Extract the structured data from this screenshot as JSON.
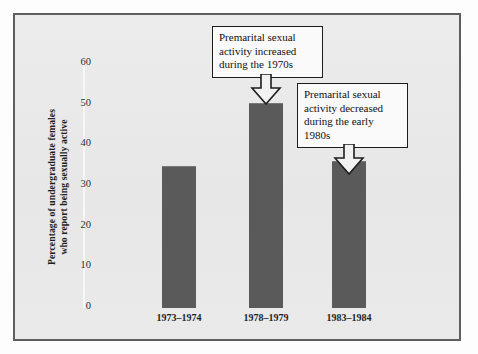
{
  "chart_data": {
    "type": "bar",
    "title": "",
    "xlabel": "",
    "ylabel": "Percentage of undergraduate females\nwho report being sexually active",
    "ylabel_line1": "Percentage of undergraduate females",
    "ylabel_line2": "who report being sexually active",
    "categories": [
      "1973–1974",
      "1978–1979",
      "1983–1984"
    ],
    "values": [
      34.6,
      50.2,
      36.0
    ],
    "ylim": [
      0,
      60
    ],
    "yticks": [
      0,
      10,
      20,
      30,
      40,
      50,
      60
    ],
    "ytick_labels": [
      "0",
      "10",
      "20",
      "30",
      "40",
      "50",
      "60"
    ],
    "grid": false,
    "legend": "none",
    "bar_color": "#5a5a5a",
    "annotations": [
      {
        "id": "callout-increase",
        "text": "Premarital sexual activity increased during the 1970s",
        "lines": [
          "Premarital sexual",
          "activity increased",
          "during the 1970s"
        ],
        "points_to_category": "1978–1979"
      },
      {
        "id": "callout-decrease",
        "text": "Premarital sexual activity decreased during the early 1980s",
        "lines": [
          "Premarital sexual",
          "activity decreased",
          "during the early",
          "1980s"
        ],
        "points_to_category": "1983–1984"
      }
    ]
  },
  "colors": {
    "bar": "#5a5a5a",
    "frame_border": "#5e5e5e",
    "panel_background": "#eaeaea",
    "text": "#1d1d1d",
    "callout_border": "#1d1d1d",
    "callout_background": "#fafafa"
  }
}
